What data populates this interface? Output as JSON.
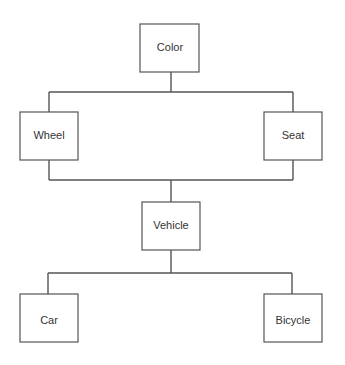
{
  "diagram": {
    "type": "hierarchy",
    "nodes": [
      {
        "id": "color",
        "label": "Color"
      },
      {
        "id": "wheel",
        "label": "Wheel"
      },
      {
        "id": "seat",
        "label": "Seat"
      },
      {
        "id": "vehicle",
        "label": "Vehicle"
      },
      {
        "id": "car",
        "label": "Car"
      },
      {
        "id": "bicycle",
        "label": "Bicycle"
      }
    ],
    "edges": [
      {
        "from": "color",
        "to": "wheel"
      },
      {
        "from": "color",
        "to": "seat"
      },
      {
        "from": "wheel",
        "to": "vehicle"
      },
      {
        "from": "seat",
        "to": "vehicle"
      },
      {
        "from": "vehicle",
        "to": "car"
      },
      {
        "from": "vehicle",
        "to": "bicycle"
      }
    ]
  },
  "colors": {
    "stroke": "#555555",
    "text": "#333333",
    "background": "#ffffff"
  }
}
